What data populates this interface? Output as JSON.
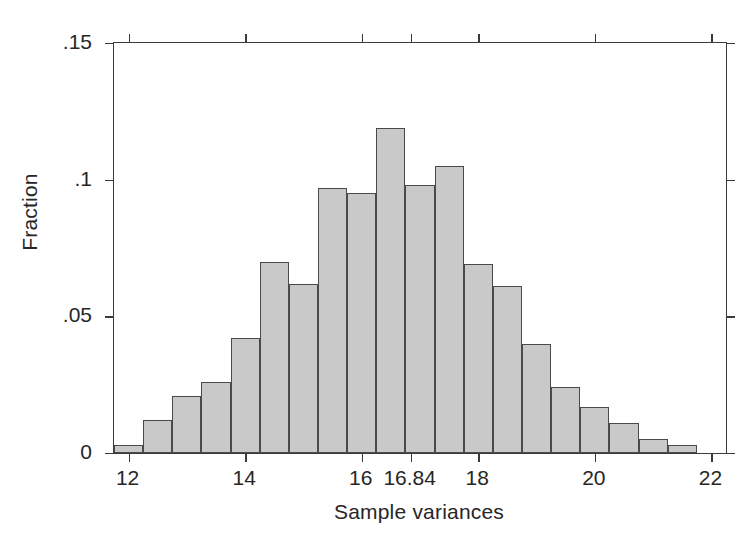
{
  "chart_data": {
    "type": "bar",
    "title": "",
    "subtitle": "",
    "xlabel": "Sample variances",
    "ylabel": "Fraction",
    "xlim": [
      11.75,
      22.25
    ],
    "ylim": [
      0,
      0.15
    ],
    "grid": false,
    "legend": "none",
    "x_ticks": [
      {
        "value": 12,
        "label": "12"
      },
      {
        "value": 14,
        "label": "14"
      },
      {
        "value": 16,
        "label": "16"
      },
      {
        "value": 16.84,
        "label": "16.84"
      },
      {
        "value": 18,
        "label": "18"
      },
      {
        "value": 20,
        "label": "20"
      },
      {
        "value": 22,
        "label": "22"
      }
    ],
    "y_ticks": [
      {
        "value": 0,
        "label": "0"
      },
      {
        "value": 0.05,
        "label": ".05"
      },
      {
        "value": 0.1,
        "label": ".1"
      },
      {
        "value": 0.15,
        "label": ".15"
      }
    ],
    "bin_width": 0.5,
    "bin_starts": [
      11.75,
      12.25,
      12.75,
      13.25,
      13.75,
      14.25,
      14.75,
      15.25,
      15.75,
      16.25,
      16.75,
      17.25,
      17.75,
      18.25,
      18.75,
      19.25,
      19.75,
      20.25,
      20.75,
      21.25,
      21.75
    ],
    "categories": [
      "11.75",
      "12.25",
      "12.75",
      "13.25",
      "13.75",
      "14.25",
      "14.75",
      "15.25",
      "15.75",
      "16.25",
      "16.75",
      "17.25",
      "17.75",
      "18.25",
      "18.75",
      "19.25",
      "19.75",
      "20.25",
      "20.75",
      "21.25",
      "21.75"
    ],
    "values": [
      0.003,
      0.012,
      0.021,
      0.026,
      0.042,
      0.07,
      0.062,
      0.097,
      0.095,
      0.119,
      0.098,
      0.105,
      0.069,
      0.061,
      0.04,
      0.024,
      0.017,
      0.011,
      0.005,
      0.003,
      0.0
    ],
    "bar_fill": "#c9c9c9",
    "bar_edge": "#4a4a4a",
    "axis_color": "#3a3a3a",
    "background": "#ffffff"
  }
}
